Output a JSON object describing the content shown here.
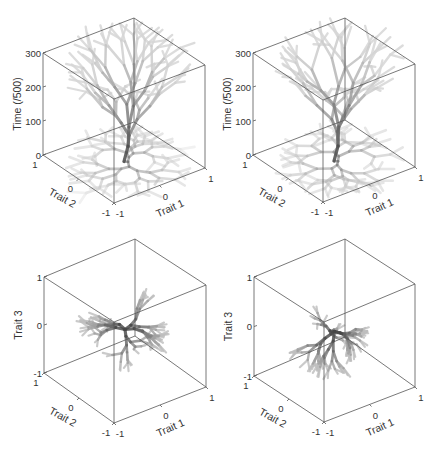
{
  "figure": {
    "width": 432,
    "height": 452,
    "background": "#ffffff",
    "axis_color": "#555555",
    "text_color": "#333333"
  },
  "chart_data": [
    {
      "type": "scatter3d",
      "panel": "top-left",
      "description": "Branching lineage tree in trait space over time with projection onto Trait1-Trait2 plane",
      "zlabel": "Time (/500)",
      "xlabel": "Trait 1",
      "ylabel": "Trait 2",
      "zticks": [
        "0",
        "100",
        "200",
        "300"
      ],
      "xticks": [
        "-1",
        "0",
        "1"
      ],
      "yticks": [
        "-1",
        "0",
        "1"
      ],
      "zlim": [
        0,
        300
      ],
      "xlim": [
        -1,
        1
      ],
      "ylim": [
        -1,
        1
      ],
      "box": {
        "top_left": [
          43,
          53
        ],
        "top_back": [
          134,
          18
        ],
        "top_right": [
          205,
          65
        ],
        "top_front": [
          114,
          99
        ],
        "bottom_left": [
          43,
          155
        ],
        "bottom_back": [
          134,
          122
        ],
        "bottom_right": [
          205,
          168
        ],
        "bottom_front": [
          114,
          203
        ]
      },
      "seed": 11,
      "mode": "time"
    },
    {
      "type": "scatter3d",
      "panel": "top-right",
      "description": "Branching lineage tree in trait space over time with projection onto Trait1-Trait2 plane",
      "zlabel": "Time (/500)",
      "xlabel": "Trait 1",
      "ylabel": "Trait 2",
      "zticks": [
        "0",
        "100",
        "200",
        "300"
      ],
      "xticks": [
        "-1",
        "0",
        "1"
      ],
      "yticks": [
        "-1",
        "0",
        "1"
      ],
      "zlim": [
        0,
        300
      ],
      "xlim": [
        -1,
        1
      ],
      "ylim": [
        -1,
        1
      ],
      "box": {
        "top_left": [
          253,
          53
        ],
        "top_back": [
          345,
          18
        ],
        "top_right": [
          415,
          64
        ],
        "top_front": [
          323,
          100
        ],
        "bottom_left": [
          253,
          155
        ],
        "bottom_back": [
          345,
          120
        ],
        "bottom_right": [
          415,
          167
        ],
        "bottom_front": [
          323,
          202
        ]
      },
      "seed": 23,
      "mode": "time"
    },
    {
      "type": "scatter3d",
      "panel": "bottom-left",
      "description": "Radially branching cluster in 3D trait space",
      "zlabel": "Trait 3",
      "xlabel": "Trait 1",
      "ylabel": "Trait 2",
      "zticks": [
        "-1",
        "0",
        "1"
      ],
      "xticks": [
        "-1",
        "0",
        "1"
      ],
      "yticks": [
        "-1",
        "0",
        "1"
      ],
      "zlim": [
        -1,
        1
      ],
      "xlim": [
        -1,
        1
      ],
      "ylim": [
        -1,
        1
      ],
      "box": {
        "top_left": [
          44,
          277
        ],
        "top_back": [
          135,
          239
        ],
        "top_right": [
          206,
          285
        ],
        "top_front": [
          114,
          322
        ],
        "bottom_left": [
          44,
          373
        ],
        "bottom_back": [
          135,
          336
        ],
        "bottom_right": [
          206,
          387
        ],
        "bottom_front": [
          114,
          423
        ]
      },
      "seed": 37,
      "mode": "trait3"
    },
    {
      "type": "scatter3d",
      "panel": "bottom-right",
      "description": "Radially branching cluster in 3D trait space",
      "zlabel": "Trait 3",
      "xlabel": "Trait 1",
      "ylabel": "Trait 2",
      "zticks": [
        "-1",
        "0",
        "1"
      ],
      "xticks": [
        "-1",
        "0",
        "1"
      ],
      "yticks": [
        "-1",
        "0",
        "1"
      ],
      "zlim": [
        -1,
        1
      ],
      "xlim": [
        -1,
        1
      ],
      "ylim": [
        -1,
        1
      ],
      "box": {
        "top_left": [
          254,
          277
        ],
        "top_back": [
          345,
          239
        ],
        "top_right": [
          415,
          284
        ],
        "top_front": [
          324,
          322
        ],
        "bottom_left": [
          254,
          376
        ],
        "bottom_back": [
          345,
          337
        ],
        "bottom_right": [
          415,
          387
        ],
        "bottom_front": [
          324,
          422
        ]
      },
      "seed": 53,
      "mode": "trait3"
    }
  ]
}
